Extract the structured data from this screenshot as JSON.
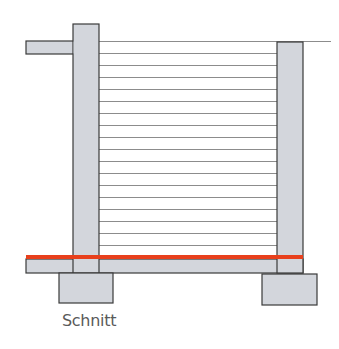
{
  "diagram": {
    "caption": "Schnitt",
    "colors": {
      "concrete_fill": "#d3d6dc",
      "outline": "#3a3a3a",
      "membrane": "#e8401c",
      "course_line": "#8c8c8c",
      "caption": "#5a5a5a"
    },
    "elements": {
      "left_wall": {
        "x": 73,
        "y": 24,
        "w": 26,
        "h": 249
      },
      "left_ledge": {
        "x": 26,
        "y": 41,
        "w": 47,
        "h": 13
      },
      "right_wall": {
        "x": 277,
        "y": 42,
        "w": 26,
        "h": 231
      },
      "floor_slab": {
        "x": 26,
        "y": 259,
        "w": 277,
        "h": 14
      },
      "membrane_line": {
        "x": 26,
        "y": 255,
        "w": 277,
        "h": 4
      },
      "left_footing": {
        "x": 59,
        "y": 273,
        "w": 54,
        "h": 30
      },
      "right_footing": {
        "x": 262,
        "y": 274,
        "w": 55,
        "h": 31
      },
      "top_line": {
        "x1": 99,
        "x2": 331,
        "y": 41
      }
    },
    "course_lines_y": [
      53,
      65,
      77,
      89,
      101,
      113,
      125,
      137,
      149,
      161,
      173,
      185,
      197,
      209,
      221,
      233,
      245
    ]
  }
}
